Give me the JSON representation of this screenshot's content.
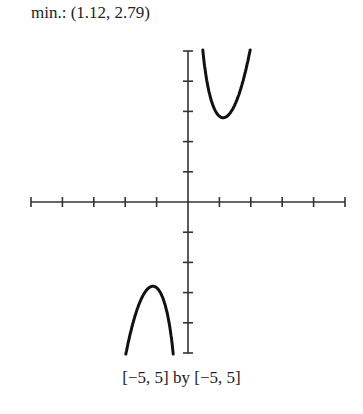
{
  "title": "min.: (1.12, 2.79)",
  "caption": "[−5,  5] by [−5,  5]",
  "chart_data": {
    "type": "line",
    "title": "min.: (1.12, 2.79)",
    "xlabel": "",
    "ylabel": "",
    "xlim": [
      -5,
      5
    ],
    "ylim": [
      -5,
      5
    ],
    "xscl": 1,
    "yscl": 1,
    "grid": false,
    "legend": null,
    "annotations": [
      "min.: (1.12, 2.79)",
      "[-5, 5] by [-5, 5]"
    ],
    "series": [
      {
        "name": "f(x)",
        "description": "odd function with vertical asymptote at x=0; local min at (1.12, 2.79), local max at (-1.12, -2.79)",
        "x": [
          0.48,
          0.6,
          0.8,
          1.0,
          1.12,
          1.3,
          1.5,
          1.7,
          2.0
        ],
        "y": [
          4.95,
          4.0,
          3.2,
          2.85,
          2.79,
          2.9,
          3.25,
          3.85,
          5.0
        ]
      },
      {
        "name": "f(x) (x<0 branch)",
        "x": [
          -2.0,
          -1.7,
          -1.5,
          -1.3,
          -1.12,
          -1.0,
          -0.8,
          -0.6,
          -0.48
        ],
        "y": [
          -5.0,
          -3.85,
          -3.25,
          -2.9,
          -2.79,
          -2.85,
          -3.2,
          -4.0,
          -4.95
        ]
      }
    ],
    "minimum": {
      "x": 1.12,
      "y": 2.79
    }
  },
  "colors": {
    "axis": "#333333",
    "curve": "#111111",
    "text": "#222222"
  }
}
